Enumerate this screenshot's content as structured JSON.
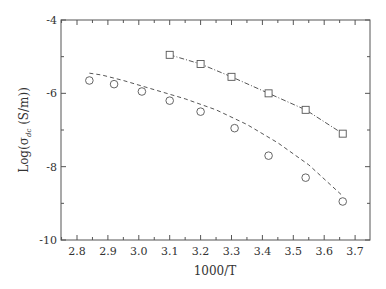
{
  "chart_data": {
    "type": "scatter",
    "title": "",
    "xlabel": "1000/T",
    "ylabel": "Log(σ_dc (S/m))",
    "xlim": [
      2.75,
      3.75
    ],
    "ylim": [
      -10,
      -4
    ],
    "x_ticks": [
      "2.8",
      "2.9",
      "3.0",
      "3.1",
      "3.2",
      "3.3",
      "3.4",
      "3.5",
      "3.6",
      "3.7"
    ],
    "y_ticks": [
      "-4",
      "-6",
      "-8",
      "-10"
    ],
    "grid": false,
    "legend": null,
    "series": [
      {
        "name": "squares",
        "marker": "square",
        "line": "dash-dot",
        "x": [
          3.1,
          3.2,
          3.3,
          3.42,
          3.54,
          3.66
        ],
        "y": [
          -4.95,
          -5.2,
          -5.55,
          -6.0,
          -6.45,
          -7.1
        ]
      },
      {
        "name": "circles",
        "marker": "circle",
        "line": "dashed",
        "x": [
          2.84,
          2.92,
          3.01,
          3.1,
          3.2,
          3.31,
          3.42,
          3.54,
          3.66
        ],
        "y": [
          -5.65,
          -5.75,
          -5.95,
          -6.2,
          -6.5,
          -6.95,
          -7.7,
          -8.3,
          -8.95
        ]
      }
    ]
  }
}
